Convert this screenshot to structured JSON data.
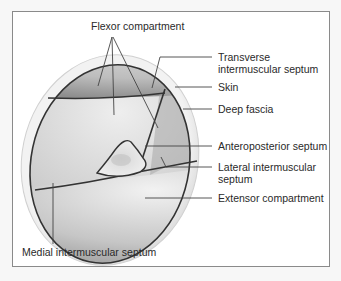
{
  "figure": {
    "type": "anatomical cross-section",
    "labels": {
      "flexor_compartment": "Flexor compartment",
      "transverse_septum_line1": "Transverse",
      "transverse_septum_line2": "intermuscular septum",
      "skin": "Skin",
      "deep_fascia": "Deep fascia",
      "anteroposterior_septum": "Anteroposterior septum",
      "lateral_septum_line1": "Lateral intermuscular",
      "lateral_septum_line2": "septum",
      "extensor_compartment": "Extensor compartment",
      "medial_septum": "Medial intermuscular septum"
    },
    "colors": {
      "background": "#ffffff",
      "frame_border": "#8a8a8a",
      "skin": "#e2e2e2",
      "muscle_light": "#dcdcdc",
      "muscle_dark": "#9a9a9a",
      "fascia_line": "#333333",
      "leader_line": "#444444"
    }
  }
}
